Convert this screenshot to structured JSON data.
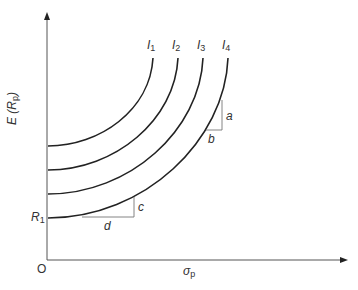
{
  "diagram": {
    "type": "indifference-curves",
    "colors": {
      "axis": "#555555",
      "curve": "#222222",
      "triangle": "#777777",
      "text": "#333333"
    },
    "axes": {
      "y_label": "E (R",
      "y_label_sub": "p",
      "y_label_close": ")",
      "x_label": "σ",
      "x_label_sub": "p",
      "origin_label": "O",
      "r1_label": "R",
      "r1_sub": "1"
    },
    "curves": [
      {
        "label": "I",
        "sub": "1",
        "start_y": 146,
        "top_x": 153
      },
      {
        "label": "I",
        "sub": "2",
        "start_y": 170,
        "top_x": 178
      },
      {
        "label": "I",
        "sub": "3",
        "start_y": 194,
        "top_x": 203
      },
      {
        "label": "I",
        "sub": "4",
        "start_y": 218,
        "top_x": 228
      }
    ],
    "slope_triangles": [
      {
        "vertical_label": "a",
        "horizontal_label": "b"
      },
      {
        "vertical_label": "c",
        "horizontal_label": "d"
      }
    ]
  }
}
